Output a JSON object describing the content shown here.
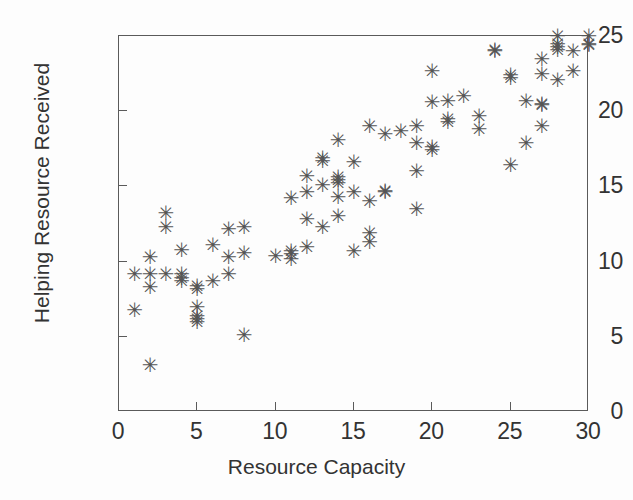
{
  "chart_data": {
    "type": "scatter",
    "title": "",
    "xlabel": "Resource Capacity",
    "ylabel": "Helping Resource Received",
    "xlim": [
      0,
      30
    ],
    "ylim": [
      0,
      25
    ],
    "xticks": [
      0,
      5,
      10,
      15,
      20,
      25,
      30
    ],
    "yticks": [
      0,
      5,
      10,
      15,
      20,
      25
    ],
    "grid": false,
    "legend": null,
    "marker": "asterisk",
    "marker_color": "#555555",
    "frame_color": "#5a5a5a",
    "text_color": "#333333",
    "background": "#fdfdfd",
    "points": [
      [
        1,
        6.7
      ],
      [
        1,
        9.1
      ],
      [
        2,
        3.0
      ],
      [
        2,
        8.2
      ],
      [
        2,
        9.1
      ],
      [
        2,
        10.2
      ],
      [
        3,
        9.1
      ],
      [
        3,
        12.2
      ],
      [
        3,
        13.1
      ],
      [
        4,
        8.6
      ],
      [
        4,
        8.8
      ],
      [
        4,
        9.1
      ],
      [
        4,
        10.7
      ],
      [
        5,
        5.9
      ],
      [
        5,
        6.1
      ],
      [
        5,
        6.3
      ],
      [
        5,
        6.9
      ],
      [
        5,
        8.1
      ],
      [
        5,
        8.3
      ],
      [
        6,
        8.6
      ],
      [
        6,
        11.0
      ],
      [
        7,
        9.1
      ],
      [
        7,
        10.2
      ],
      [
        7,
        12.1
      ],
      [
        8,
        5.0
      ],
      [
        8,
        10.5
      ],
      [
        8,
        12.2
      ],
      [
        10,
        10.3
      ],
      [
        11,
        10.1
      ],
      [
        11,
        10.4
      ],
      [
        11,
        10.6
      ],
      [
        11,
        14.1
      ],
      [
        12,
        10.9
      ],
      [
        12,
        12.7
      ],
      [
        12,
        14.5
      ],
      [
        12,
        15.6
      ],
      [
        13,
        12.2
      ],
      [
        13,
        15.0
      ],
      [
        13,
        16.6
      ],
      [
        13,
        16.8
      ],
      [
        14,
        12.9
      ],
      [
        14,
        14.2
      ],
      [
        14,
        15.1
      ],
      [
        14,
        15.3
      ],
      [
        14,
        15.5
      ],
      [
        14,
        18.0
      ],
      [
        15,
        10.6
      ],
      [
        15,
        14.5
      ],
      [
        15,
        16.5
      ],
      [
        16,
        11.2
      ],
      [
        16,
        11.8
      ],
      [
        16,
        13.9
      ],
      [
        16,
        18.9
      ],
      [
        17,
        14.5
      ],
      [
        17,
        14.6
      ],
      [
        17,
        18.4
      ],
      [
        18,
        18.6
      ],
      [
        19,
        13.4
      ],
      [
        19,
        15.9
      ],
      [
        19,
        17.8
      ],
      [
        19,
        18.9
      ],
      [
        20,
        17.3
      ],
      [
        20,
        17.5
      ],
      [
        20,
        20.5
      ],
      [
        20,
        22.6
      ],
      [
        21,
        19.2
      ],
      [
        21,
        19.4
      ],
      [
        21,
        20.6
      ],
      [
        22,
        20.9
      ],
      [
        23,
        18.7
      ],
      [
        23,
        19.6
      ],
      [
        24,
        23.9
      ],
      [
        24,
        24.0
      ],
      [
        25,
        16.3
      ],
      [
        25,
        22.1
      ],
      [
        25,
        22.3
      ],
      [
        26,
        17.8
      ],
      [
        26,
        20.6
      ],
      [
        27,
        18.9
      ],
      [
        27,
        20.3
      ],
      [
        27,
        20.4
      ],
      [
        27,
        22.4
      ],
      [
        27,
        23.4
      ],
      [
        28,
        22.0
      ],
      [
        28,
        24.0
      ],
      [
        28,
        24.2
      ],
      [
        28,
        24.4
      ],
      [
        28,
        24.9
      ],
      [
        29,
        22.6
      ],
      [
        29,
        23.9
      ],
      [
        30,
        24.3
      ],
      [
        30,
        24.4
      ],
      [
        30,
        24.9
      ]
    ]
  },
  "axis": {
    "x_tick_labels": [
      "0",
      "5",
      "10",
      "15",
      "20",
      "25",
      "30"
    ],
    "y_tick_labels": [
      "0",
      "5",
      "10",
      "15",
      "20",
      "25"
    ],
    "x_title": "Resource Capacity",
    "y_title": "Helping Resource Received"
  }
}
